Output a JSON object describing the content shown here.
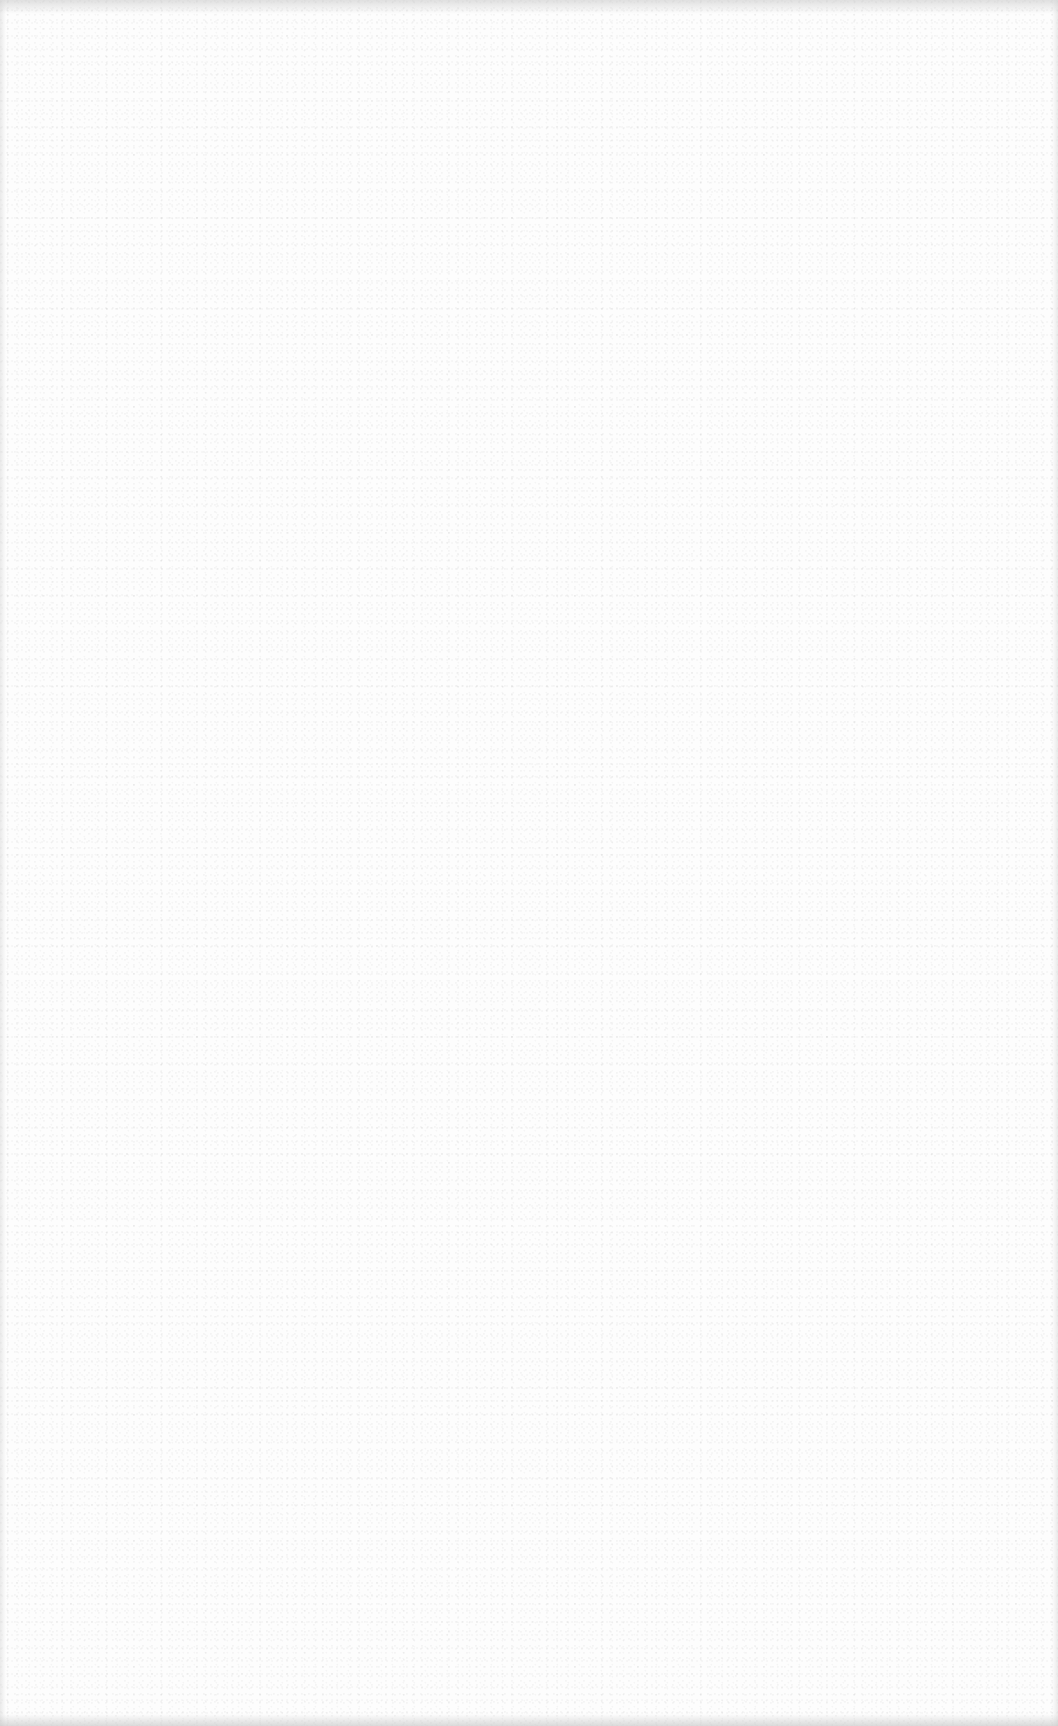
{
  "surface": {
    "background_color": "#fdfdfd",
    "edge_shade_color": "#c8c8c8",
    "texture": "speckle-noise"
  }
}
